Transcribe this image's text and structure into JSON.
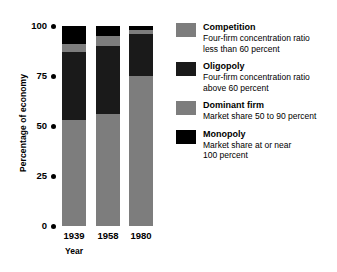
{
  "chart_data": {
    "type": "bar",
    "subtype": "stacked-bar",
    "title": "",
    "xlabel": "Year",
    "ylabel": "Percentage of economy",
    "categories": [
      "1939",
      "1958",
      "1980"
    ],
    "ylim": [
      0,
      100
    ],
    "yticks": [
      0,
      25,
      50,
      75,
      100
    ],
    "ytick_labels": [
      "0",
      "25",
      "50",
      "75",
      "100"
    ],
    "grid": false,
    "legend_position": "right",
    "stack_order_bottom_to_top": [
      "Monopoly",
      "Dominant firm",
      "Oligopoly",
      "Competition"
    ],
    "series": [
      {
        "name": "Competition",
        "color": "#7d7d7d",
        "values": [
          53,
          56,
          75
        ]
      },
      {
        "name": "Oligopoly",
        "color": "#1a1a1a",
        "values": [
          34,
          34,
          21
        ]
      },
      {
        "name": "Dominant firm",
        "color": "#7d7d7d",
        "values": [
          4,
          5,
          2
        ]
      },
      {
        "name": "Monopoly",
        "color": "#000000",
        "values": [
          9,
          5,
          2
        ]
      }
    ]
  },
  "axes": {
    "y_title": "Percentage of economy",
    "x_title": "Year",
    "y_ticks": [
      {
        "label": "100",
        "top": 20
      },
      {
        "label": "75",
        "top": 70
      },
      {
        "label": "50",
        "top": 120
      },
      {
        "label": "25",
        "top": 170
      },
      {
        "label": "0",
        "top": 220
      }
    ],
    "x_labels": [
      "1939",
      "1958",
      "1980"
    ]
  },
  "legend": {
    "items": [
      {
        "swatch_color": "#7d7d7d",
        "title": "Competition",
        "desc_line1": "Four-firm concentration ratio",
        "desc_line2": "less than 60 percent"
      },
      {
        "swatch_color": "#1a1a1a",
        "title": "Oligopoly",
        "desc_line1": "Four-firm concentration ratio",
        "desc_line2": "above 60 percent"
      },
      {
        "swatch_color": "#7d7d7d",
        "title": "Dominant firm",
        "desc_line1": "Market share 50 to 90 percent",
        "desc_line2": ""
      },
      {
        "swatch_color": "#000000",
        "title": "Monopoly",
        "desc_line1": "Market share at or near",
        "desc_line2": "100 percent"
      }
    ]
  }
}
